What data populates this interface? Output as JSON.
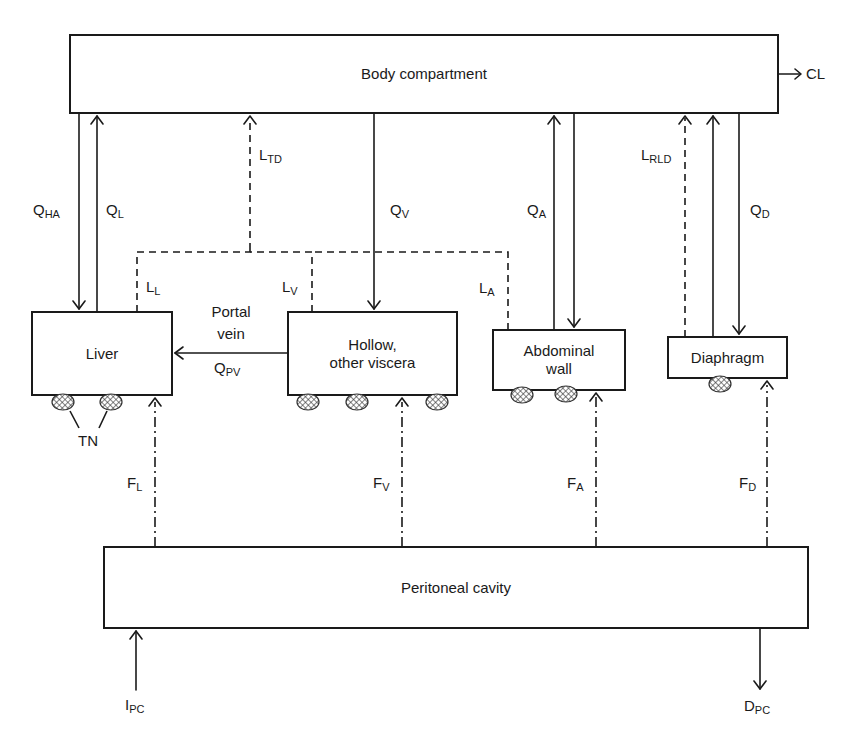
{
  "compartments": {
    "body": "Body compartment",
    "liver": "Liver",
    "hollow": "Hollow, other viscera",
    "hollow_line1": "Hollow,",
    "hollow_line2": "other viscera",
    "abdominal_line1": "Abdominal",
    "abdominal_line2": "wall",
    "diaphragm": "Diaphragm",
    "peritoneal": "Peritoneal cavity"
  },
  "flows": {
    "CL": {
      "main": "CL",
      "sub": ""
    },
    "QHA": {
      "main": "Q",
      "sub": "HA"
    },
    "QL": {
      "main": "Q",
      "sub": "L"
    },
    "LTD": {
      "main": "L",
      "sub": "TD"
    },
    "QV": {
      "main": "Q",
      "sub": "V"
    },
    "QA": {
      "main": "Q",
      "sub": "A"
    },
    "LRLD": {
      "main": "L",
      "sub": "RLD"
    },
    "QD": {
      "main": "Q",
      "sub": "D"
    },
    "LL": {
      "main": "L",
      "sub": "L"
    },
    "LV": {
      "main": "L",
      "sub": "V"
    },
    "LA": {
      "main": "L",
      "sub": "A"
    },
    "portal_line1": "Portal",
    "portal_line2": "vein",
    "QPV": {
      "main": "Q",
      "sub": "PV"
    },
    "TN": "TN",
    "FL": {
      "main": "F",
      "sub": "L"
    },
    "FV": {
      "main": "F",
      "sub": "V"
    },
    "FA": {
      "main": "F",
      "sub": "A"
    },
    "FD": {
      "main": "F",
      "sub": "D"
    },
    "IPC": {
      "main": "I",
      "sub": "PC"
    },
    "DPC": {
      "main": "D",
      "sub": "PC"
    }
  },
  "legend_styles": {
    "solid": "blood flow",
    "dashed": "lymph flow",
    "dash_dot": "peritoneal absorption"
  }
}
